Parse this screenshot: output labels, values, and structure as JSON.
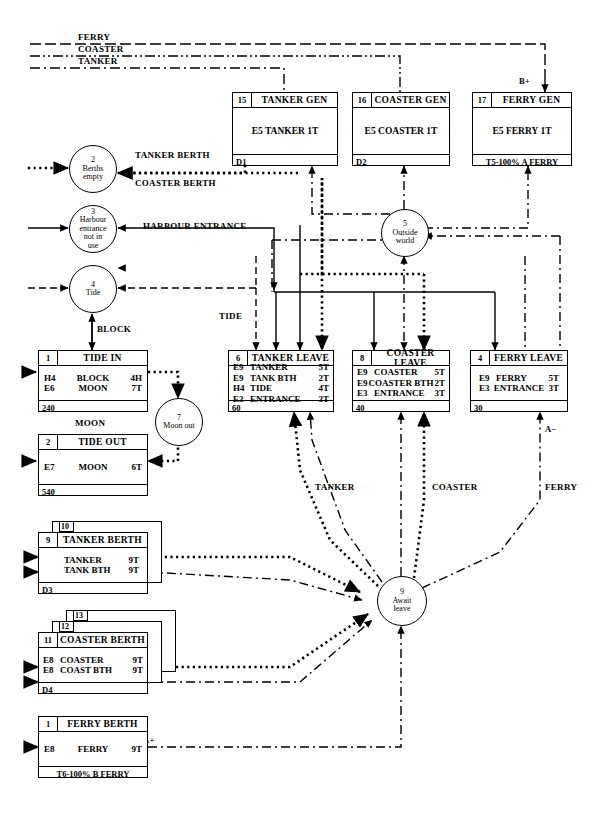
{
  "diagram": {
    "top_flow_labels": [
      "FERRY",
      "COASTER",
      "TANKER"
    ],
    "generator_boxes": [
      {
        "num": "15",
        "title": "TANKER GEN",
        "body": "E5 TANKER 1T",
        "footer": "D1"
      },
      {
        "num": "16",
        "title": "COASTER GEN",
        "body": "E5 COASTER 1T",
        "footer": "D2"
      },
      {
        "num": "17",
        "title": "FERRY GEN",
        "body": "E5 FERRY 1T",
        "footer": "T5-100% A FERRY"
      }
    ],
    "left_circles": [
      {
        "num": "2",
        "label_line1": "Berths",
        "label_line2": "empty",
        "label_line3": "",
        "label_line4": ""
      },
      {
        "num": "3",
        "label_line1": "Harbour",
        "label_line2": "entrance",
        "label_line3": "not in",
        "label_line4": "use"
      },
      {
        "num": "4",
        "label_line1": "Tide",
        "label_line2": "",
        "label_line3": "",
        "label_line4": ""
      }
    ],
    "circles": {
      "outside_world": {
        "num": "5",
        "line1": "Outside",
        "line2": "world"
      },
      "moon_out": {
        "num": "7",
        "line1": "Moon out",
        "line2": ""
      },
      "await_leave": {
        "num": "9",
        "line1": "Await",
        "line2": "leave"
      }
    },
    "edge_labels": {
      "tanker_berth": "TANKER BERTH",
      "coaster_berth": "COASTER BERTH",
      "harbour_entrance": "HARBOUR  ENTRANCE",
      "tide": "TIDE",
      "block": "BLOCK",
      "moon": "MOON",
      "tanker": "TANKER",
      "coaster": "COASTER",
      "ferry": "FERRY",
      "b_plus": "B+",
      "a_minus": "A−",
      "a_plus": "A+"
    },
    "tide_boxes": [
      {
        "num": "1",
        "title": "TIDE IN",
        "rows": [
          {
            "e": "H4",
            "name": "BLOCK",
            "t": "4H"
          },
          {
            "e": "E6",
            "name": "MOON",
            "t": "7T"
          }
        ],
        "footer": "240"
      },
      {
        "num": "2",
        "title": "TIDE OUT",
        "rows": [
          {
            "e": "E7",
            "name": "MOON",
            "t": "6T"
          }
        ],
        "footer": "540"
      }
    ],
    "leave_boxes": [
      {
        "num": "6",
        "title": "TANKER LEAVE",
        "rows": [
          {
            "e": "E9",
            "name": "TANKER",
            "t": "5T"
          },
          {
            "e": "E9",
            "name": "TANK BTH",
            "t": "2T"
          },
          {
            "e": "H4",
            "name": "TIDE",
            "t": "4T"
          },
          {
            "e": "E3",
            "name": "ENTRANCE",
            "t": "3T"
          }
        ],
        "footer": "60"
      },
      {
        "num": "8",
        "title": "COASTER LEAVE",
        "rows": [
          {
            "e": "E9",
            "name": "COASTER",
            "t": "5T"
          },
          {
            "e": "E9",
            "name": "COASTER BTH",
            "t": "2T"
          },
          {
            "e": "E3",
            "name": "ENTRANCE",
            "t": "3T"
          }
        ],
        "footer": "40"
      },
      {
        "num": "4",
        "title": "FERRY LEAVE",
        "rows": [
          {
            "e": "E9",
            "name": "FERRY",
            "t": "5T"
          },
          {
            "e": "E3",
            "name": "ENTRANCE",
            "t": "3T"
          }
        ],
        "footer": "30"
      }
    ],
    "berth_boxes": [
      {
        "num": "9",
        "title": "TANKER BERTH",
        "stack_nums": [
          "10"
        ],
        "rows": [
          {
            "e": "",
            "name": "TANKER",
            "t": "9T"
          },
          {
            "e": "",
            "name": "TANK BTH",
            "t": "9T"
          }
        ],
        "footer": "D3"
      },
      {
        "num": "11",
        "title": "COASTER BERTH",
        "stack_nums": [
          "13",
          "12"
        ],
        "rows": [
          {
            "e": "E8",
            "name": "COASTER",
            "t": "9T"
          },
          {
            "e": "E8",
            "name": "COAST BTH",
            "t": "9T"
          }
        ],
        "footer": "D4"
      },
      {
        "num": "1",
        "title": "FERRY BERTH",
        "stack_nums": [],
        "rows": [
          {
            "e": "E8",
            "name": "FERRY",
            "t": "9T"
          }
        ],
        "footer": "T6-100% B FERRY"
      }
    ]
  }
}
